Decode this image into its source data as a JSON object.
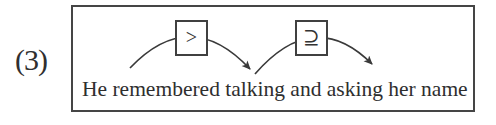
{
  "figure": {
    "label": "(3)",
    "sentence": "He remembered talking and asking her name",
    "relations": [
      {
        "symbol": ">"
      },
      {
        "symbol": "⊇"
      }
    ],
    "colors": {
      "ink": "#3a3a3a",
      "background": "#ffffff"
    }
  }
}
